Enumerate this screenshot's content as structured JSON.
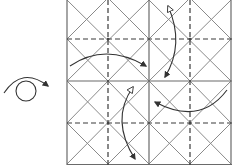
{
  "diagram": {
    "type": "origami-crease-pattern",
    "colors": {
      "solid_line": "#8a8a8a",
      "frame_line": "#6a6a6a",
      "dashed_line": "#3a3a3a",
      "arrow": "#333333",
      "background": "#ffffff"
    },
    "grid": {
      "left": 67,
      "top": 0,
      "right": 231,
      "bottom": 164,
      "block_size": 82,
      "solid_verticals": [
        67,
        149,
        231
      ],
      "dashed_verticals": [
        108,
        190
      ],
      "solid_horizontals": [
        0,
        81,
        164
      ],
      "dashed_horizontals": [
        39,
        123
      ]
    },
    "symbols": [
      {
        "name": "turn-over-symbol",
        "meaning": "turn model over"
      }
    ],
    "arrows": [
      {
        "name": "fold-arrow-top-left",
        "meaning": "fold in, pointing toward center"
      },
      {
        "name": "fold-arrow-top-right",
        "meaning": "valley-mountain arrow up/down"
      },
      {
        "name": "fold-arrow-bottom-left",
        "meaning": "valley-mountain arrow up/down"
      },
      {
        "name": "fold-arrow-bottom-right",
        "meaning": "fold in, pointing toward center"
      }
    ]
  }
}
